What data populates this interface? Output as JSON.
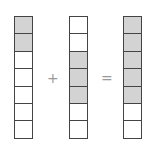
{
  "columns": [
    {
      "cells": 7,
      "shaded": [
        0,
        1
      ]
    },
    {
      "cells": 7,
      "shaded": [
        2,
        3,
        4
      ]
    },
    {
      "cells": 7,
      "shaded": [
        0,
        1,
        2,
        3,
        4
      ]
    }
  ],
  "operators": {
    "plus": "+",
    "equals": "="
  },
  "colors": {
    "shaded": "#d3d3d3",
    "border": "#444444"
  }
}
